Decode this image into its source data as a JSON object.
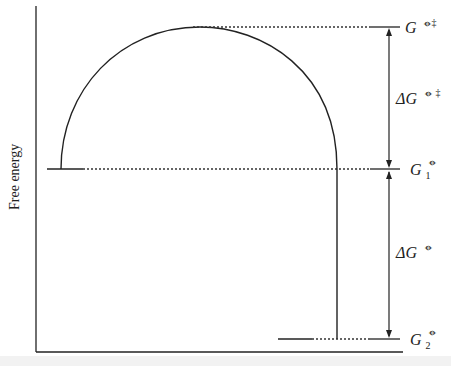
{
  "diagram": {
    "type": "free-energy-profile",
    "y_axis_label": "Free energy",
    "levels": {
      "transition_state": {
        "symbol": "G",
        "superscript": "⦵‡"
      },
      "initial_state": {
        "symbol": "G",
        "subscript": "1",
        "superscript": "⦵"
      },
      "final_state": {
        "symbol": "G",
        "subscript": "2",
        "superscript": "⦵"
      }
    },
    "differences": {
      "activation": {
        "symbol": "ΔG",
        "superscript": "⦵ ‡"
      },
      "reaction": {
        "symbol": "ΔG",
        "superscript": "⦵"
      }
    },
    "colors": {
      "line": "#222222",
      "dotted": "#333333"
    }
  }
}
